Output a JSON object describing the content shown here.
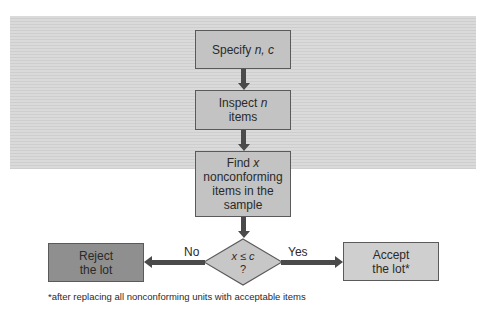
{
  "diagram": {
    "type": "flowchart",
    "title": "",
    "nodes": [
      {
        "id": "specify",
        "shape": "rect",
        "lines": [
          "Specify n, c"
        ]
      },
      {
        "id": "inspect",
        "shape": "rect",
        "lines": [
          "Inspect n",
          "items"
        ]
      },
      {
        "id": "find",
        "shape": "rect",
        "lines": [
          "Find x",
          "nonconforming",
          "items in the",
          "sample"
        ]
      },
      {
        "id": "decision",
        "shape": "diamond",
        "lines": [
          "x ≤ c",
          "?"
        ]
      },
      {
        "id": "reject",
        "shape": "rect",
        "lines": [
          "Reject",
          "the lot"
        ]
      },
      {
        "id": "accept",
        "shape": "rect",
        "lines": [
          "Accept",
          "the lot*"
        ]
      }
    ],
    "edges": [
      {
        "from": "specify",
        "to": "inspect",
        "label": ""
      },
      {
        "from": "inspect",
        "to": "find",
        "label": ""
      },
      {
        "from": "find",
        "to": "decision",
        "label": ""
      },
      {
        "from": "decision",
        "to": "reject",
        "label": "No"
      },
      {
        "from": "decision",
        "to": "accept",
        "label": "Yes"
      }
    ],
    "footnote": "*after replacing all nonconforming units with acceptable items"
  },
  "labels": {
    "specify_text": "Specify ",
    "specify_vars": "n, c",
    "inspect_text": "Inspect ",
    "inspect_var": "n",
    "inspect_line2": "items",
    "find_text": "Find ",
    "find_var": "x",
    "find_line2": "nonconforming",
    "find_line3": "items in the",
    "find_line4": "sample",
    "decision_line1": "x ≤ c",
    "decision_line2": "?",
    "reject_line1": "Reject",
    "reject_line2": "the lot",
    "accept_line1": "Accept",
    "accept_line2": "the lot*",
    "no": "No",
    "yes": "Yes"
  },
  "colors": {
    "background": "#d6d6d6",
    "box": "#c3c3c3",
    "reject_box": "#8f8f8f",
    "accept_box": "#cfcfcf",
    "arrow": "#4a4a4a"
  }
}
